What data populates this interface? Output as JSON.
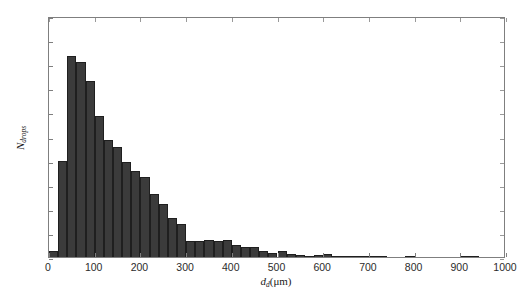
{
  "figure": {
    "background": "#ffffff",
    "bar_color": "#3b3b3b",
    "axis_color": "#7f7f7f"
  },
  "chart_data": {
    "type": "bar",
    "title": "",
    "subtitle": "",
    "xlabel": "d_d(μm)",
    "xlabel_base": "d",
    "xlabel_sub": "d",
    "xlabel_units": "(μm)",
    "ylabel": "N_drops",
    "ylabel_base": "N",
    "ylabel_sub": "drops",
    "xlim": [
      0,
      1000
    ],
    "ylim": [
      0,
      500
    ],
    "xticks": [
      0,
      100,
      200,
      300,
      400,
      500,
      600,
      700,
      800,
      900,
      1000
    ],
    "yticks": [
      0,
      50,
      100,
      150,
      200,
      250,
      300,
      350,
      400,
      450,
      500
    ],
    "grid": false,
    "legend": null,
    "bin_width": 20,
    "categories": [
      10,
      30,
      50,
      70,
      90,
      110,
      130,
      150,
      170,
      190,
      210,
      230,
      250,
      270,
      290,
      310,
      330,
      350,
      370,
      390,
      410,
      430,
      450,
      470,
      490,
      510,
      530,
      550,
      570,
      590,
      610,
      630,
      650,
      670,
      690,
      710,
      730,
      750,
      770,
      790,
      810,
      830,
      850,
      870,
      890,
      910,
      930,
      950,
      970,
      990
    ],
    "bin_edges": [
      0,
      20,
      40,
      60,
      80,
      100,
      120,
      140,
      160,
      180,
      200,
      220,
      240,
      260,
      280,
      300,
      320,
      340,
      360,
      380,
      400,
      420,
      440,
      460,
      480,
      500,
      520,
      540,
      560,
      580,
      600,
      620,
      640,
      660,
      680,
      700,
      720,
      740,
      760,
      780,
      800,
      820,
      840,
      860,
      880,
      900,
      920,
      940,
      960,
      980,
      1000
    ],
    "values": [
      12,
      200,
      418,
      404,
      366,
      292,
      242,
      228,
      197,
      178,
      166,
      131,
      109,
      80,
      68,
      33,
      33,
      35,
      33,
      36,
      24,
      20,
      20,
      13,
      8,
      12,
      7,
      5,
      3,
      5,
      6,
      3,
      3,
      2,
      2,
      3,
      1,
      0,
      0,
      1,
      0,
      0,
      0,
      0,
      0,
      1,
      1,
      0,
      0,
      0
    ]
  }
}
